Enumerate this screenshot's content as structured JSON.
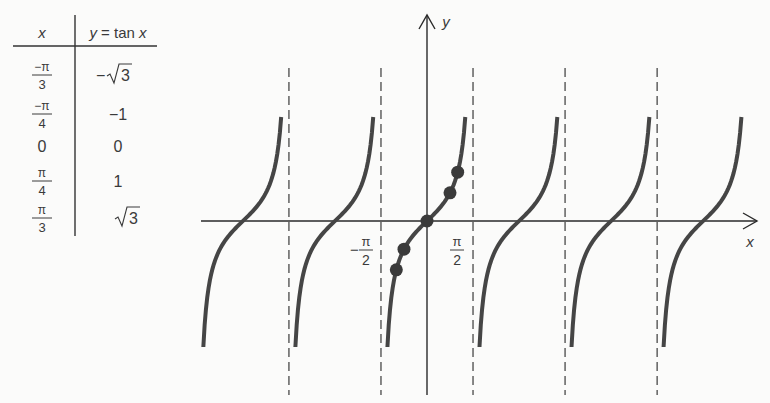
{
  "table": {
    "headers": {
      "x": "x",
      "y": "y = tan x",
      "y_var": "y",
      "y_eq": " = tan ",
      "y_x": "x"
    },
    "rows": [
      {
        "x": "−π/3",
        "x_num": "−π",
        "x_den": "3",
        "y": "−√3",
        "y_sign": "−",
        "y_root": "3",
        "y_type": "sqrt"
      },
      {
        "x": "−π/4",
        "x_num": "−π",
        "x_den": "4",
        "y": "−1",
        "y_type": "text"
      },
      {
        "x": "0",
        "x_type": "text",
        "y": "0",
        "y_type": "text"
      },
      {
        "x": "π/4",
        "x_num": "π",
        "x_den": "4",
        "y": "1",
        "y_type": "text"
      },
      {
        "x": "π/3",
        "x_num": "π",
        "x_den": "3",
        "y": "√3",
        "y_sign": "",
        "y_root": "3",
        "y_type": "sqrt"
      }
    ]
  },
  "chart_data": {
    "type": "line",
    "title": "",
    "function": "y = tan x",
    "xlabel": "x",
    "ylabel": "y",
    "tick_labels": [
      {
        "value": -1.5708,
        "label": "−π/2",
        "num": "π",
        "den": "2",
        "sign": "−"
      },
      {
        "value": 1.5708,
        "label": "π/2",
        "num": "π",
        "den": "2",
        "sign": ""
      }
    ],
    "asymptotes": [
      -7.854,
      -4.712,
      -1.5708,
      1.5708,
      4.712,
      7.854
    ],
    "asymptote_labels": [
      "−5π/2",
      "−3π/2",
      "−π/2",
      "π/2",
      "3π/2",
      "5π/2"
    ],
    "branches_visible": 6,
    "branch_centers": [
      -6.283,
      -3.1416,
      0,
      3.1416,
      6.283,
      9.425
    ],
    "xlim": [
      -7.2,
      10.8
    ],
    "ylim_visible": [
      -4.5,
      7.5
    ],
    "branch_y_range": [
      -4.5,
      3.7
    ],
    "points": [
      {
        "x": -1.0472,
        "y": -1.732,
        "label": "(−π/3, −√3)"
      },
      {
        "x": -0.7854,
        "y": -1,
        "label": "(−π/4, −1)"
      },
      {
        "x": 0,
        "y": 0,
        "label": "(0, 0)"
      },
      {
        "x": 0.7854,
        "y": 1,
        "label": "(π/4, 1)"
      },
      {
        "x": 1.0472,
        "y": 1.732,
        "label": "(π/3, √3)"
      }
    ],
    "grid": false,
    "legend": null
  },
  "style": {
    "curve_color": "#454545",
    "axis_color": "#2a2a2a",
    "dash_color": "#3a3a3a",
    "background": "#fbfbfa"
  },
  "layout": {
    "origin_px": [
      427,
      221
    ],
    "px_per_rad": 29.3,
    "px_per_unit_y": 28.2,
    "x_axis_px": [
      201,
      757
    ],
    "y_axis_px": [
      15,
      395
    ],
    "asymptote_px_y": [
      68,
      395
    ],
    "curve_top_px": 117,
    "curve_bottom_px": 347
  }
}
